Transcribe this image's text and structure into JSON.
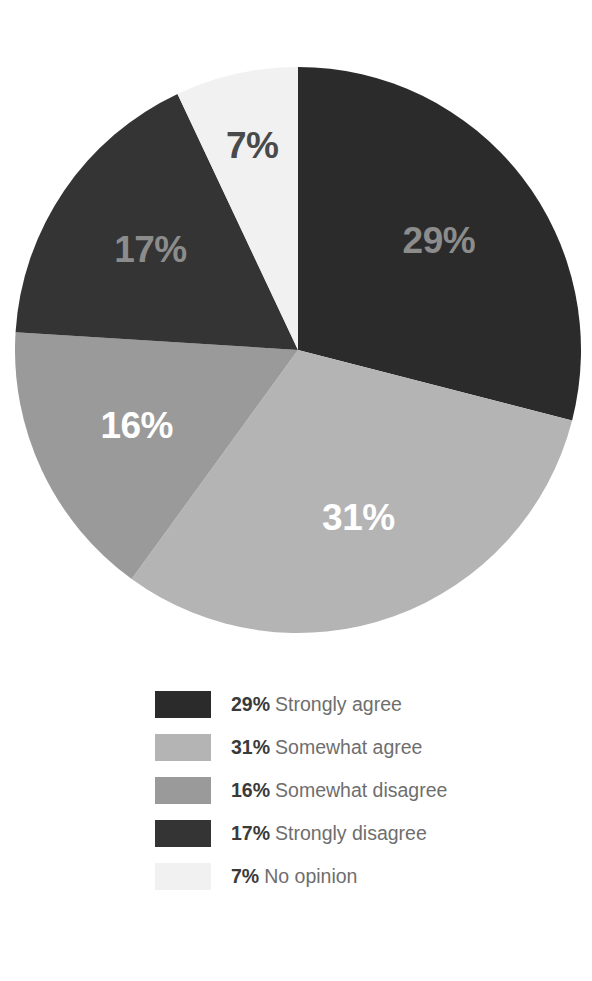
{
  "chart_data": {
    "type": "pie",
    "title": "",
    "subtitle": "",
    "xlabel": "",
    "ylabel": "",
    "grid": false,
    "legend_position": "bottom",
    "start_angle_deg": 0,
    "direction": "clockwise",
    "units": "percent",
    "total": 100,
    "categories": [
      "Strongly agree",
      "Somewhat agree",
      "Somewhat disagree",
      "Strongly disagree",
      "No opinion"
    ],
    "values": [
      29,
      31,
      16,
      17,
      7
    ],
    "labels": [
      "29%",
      "31%",
      "16%",
      "17%",
      "7%"
    ],
    "colors": [
      "#2b2b2b",
      "#b4b4b4",
      "#9a9a9a",
      "#343434",
      "#f1f1f1"
    ],
    "label_colors": [
      "#8c8c8c",
      "#ffffff",
      "#ffffff",
      "#8c8c8c",
      "#4a4a4a"
    ],
    "slices": [
      {
        "category": "Strongly agree",
        "value": 29,
        "label": "29%",
        "color": "#2b2b2b",
        "label_color": "#8c8c8c"
      },
      {
        "category": "Somewhat agree",
        "value": 31,
        "label": "31%",
        "color": "#b4b4b4",
        "label_color": "#ffffff"
      },
      {
        "category": "Somewhat disagree",
        "value": 16,
        "label": "16%",
        "color": "#9a9a9a",
        "label_color": "#ffffff"
      },
      {
        "category": "Strongly disagree",
        "value": 17,
        "label": "17%",
        "color": "#343434",
        "label_color": "#8c8c8c"
      },
      {
        "category": "No opinion",
        "value": 7,
        "label": "7%",
        "color": "#f1f1f1",
        "label_color": "#4a4a4a"
      }
    ]
  },
  "legend": {
    "items": [
      {
        "percent": "29%",
        "name": "Strongly agree",
        "color": "#2b2b2b"
      },
      {
        "percent": "31%",
        "name": "Somewhat agree",
        "color": "#b4b4b4"
      },
      {
        "percent": "16%",
        "name": "Somewhat disagree",
        "color": "#9a9a9a"
      },
      {
        "percent": "17%",
        "name": "Strongly disagree",
        "color": "#343434"
      },
      {
        "percent": "7%",
        "name": "No opinion",
        "color": "#f1f1f1"
      }
    ]
  },
  "theme": {
    "background": "#ffffff",
    "legend_percent_color": "#3a3a3a",
    "legend_name_color": "#6e6e6e"
  }
}
